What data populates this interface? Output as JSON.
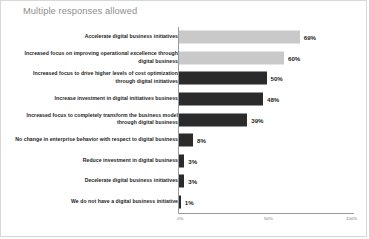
{
  "chart_data": {
    "type": "bar",
    "orientation": "horizontal",
    "title": "Multiple responses allowed",
    "xlabel": "",
    "ylabel": "",
    "xlim": [
      0,
      100
    ],
    "grid": false,
    "legend": null,
    "x_ticks": [
      {
        "label": "0%",
        "value": 0
      },
      {
        "label": "50%",
        "value": 50
      },
      {
        "label": "100%",
        "value": 100
      }
    ],
    "categories": [
      "Accelerate digital business initiatives",
      "Increased focus on improving operational excellence through digital business",
      "Increased focus to drive higher levels of cost optimization through digital initiatives",
      "Increase investment in digital initiatives business",
      "Increased focus to completely transform the business model through digital business",
      "No change in enterprise behavior with respect to digital business",
      "Reduce investment in digital business",
      "Decelerate digital business initiatives",
      "We do not have a digital business initiative"
    ],
    "values": [
      69,
      60,
      50,
      48,
      39,
      8,
      3,
      3,
      1
    ],
    "value_labels": [
      "69%",
      "60%",
      "50%",
      "48%",
      "39%",
      "8%",
      "3%",
      "3%",
      "1%"
    ],
    "bar_colors": [
      "#c9c9c9",
      "#c9c9c9",
      "#2b2b2b",
      "#2b2b2b",
      "#2b2b2b",
      "#2b2b2b",
      "#2b2b2b",
      "#2b2b2b",
      "#2b2b2b"
    ],
    "colors": {
      "light_bar": "#c9c9c9",
      "dark_bar": "#2b2b2b",
      "title": "#8e8e8e",
      "axis": "#9a9a9a",
      "label_text": "#1c1c1c",
      "tick_text": "#7a7a7a",
      "background": "#ffffff",
      "border": "#d8d8d8"
    }
  }
}
